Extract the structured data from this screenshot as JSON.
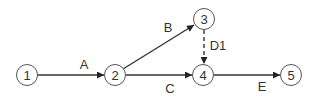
{
  "diagram": {
    "type": "activity-on-arrow network",
    "nodes": [
      {
        "id": "1",
        "label": "1",
        "x": 27,
        "y": 75
      },
      {
        "id": "2",
        "label": "2",
        "x": 115,
        "y": 75
      },
      {
        "id": "3",
        "label": "3",
        "x": 204,
        "y": 19
      },
      {
        "id": "4",
        "label": "4",
        "x": 203,
        "y": 75
      },
      {
        "id": "5",
        "label": "5",
        "x": 291,
        "y": 75
      }
    ],
    "edges": [
      {
        "id": "A",
        "label": "A",
        "from": "1",
        "to": "2",
        "style": "solid"
      },
      {
        "id": "B",
        "label": "B",
        "from": "2",
        "to": "3",
        "style": "solid"
      },
      {
        "id": "C",
        "label": "C",
        "from": "2",
        "to": "4",
        "style": "solid"
      },
      {
        "id": "D1",
        "label": "D1",
        "from": "3",
        "to": "4",
        "style": "dashed"
      },
      {
        "id": "E",
        "label": "E",
        "from": "4",
        "to": "5",
        "style": "solid"
      }
    ],
    "colors": {
      "line": "#333333",
      "node_stroke": "#555555",
      "background": "#ffffff"
    }
  }
}
